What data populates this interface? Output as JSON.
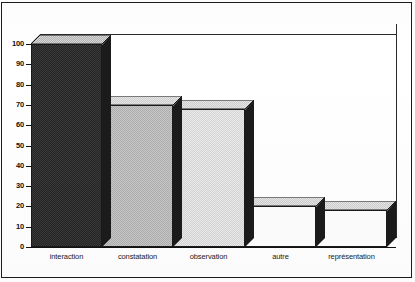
{
  "chart_data": {
    "type": "bar",
    "title": "",
    "subtitle": "",
    "xlabel": "",
    "ylabel": "",
    "categories": [
      "interaction",
      "constatation",
      "observation",
      "autre",
      "représentation"
    ],
    "values": [
      100,
      70,
      68,
      20,
      18
    ],
    "series": [
      {
        "name": "",
        "values": [
          100,
          70,
          68,
          20,
          18
        ]
      }
    ],
    "ylim": [
      0,
      100
    ],
    "ytick_labels": [
      "0",
      "10",
      "20",
      "30",
      "40",
      "50",
      "60",
      "70",
      "80",
      "90",
      "100"
    ],
    "ytick_values": [
      0,
      10,
      20,
      30,
      40,
      50,
      60,
      70,
      80,
      90,
      100
    ],
    "grid": false,
    "legend": false,
    "legend_position": "none",
    "style": "3d-bar",
    "bar_fills": [
      "dark-dither",
      "mid-dither",
      "light-dither",
      "white",
      "white"
    ],
    "colors": {
      "bar_dark": "#242424",
      "bar_mid": "#c9c9c9",
      "bar_light": "#ececed",
      "bar_white": "#fdfdfd",
      "bar_side": "#1b1b1b",
      "axis": "#111111",
      "frame": "#1c1c1c",
      "background": "#ffffff"
    }
  },
  "figure": {
    "frame_visible": true,
    "plot_box_visible": true
  }
}
